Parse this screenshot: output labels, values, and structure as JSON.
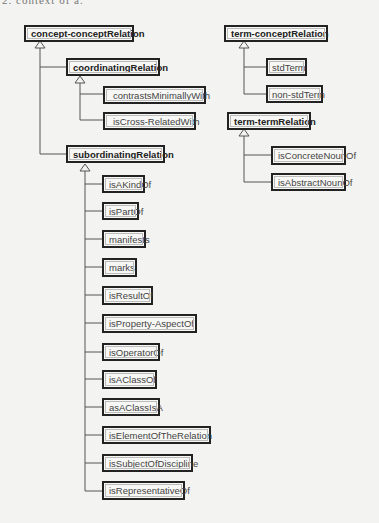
{
  "caption": "2. context of a.",
  "colors": {
    "line": "#555555",
    "box_border": "#222222",
    "background": "#f3f3f1"
  },
  "diagram": {
    "type": "class-hierarchy",
    "trees": [
      {
        "root": "concept-conceptRelation",
        "children": [
          {
            "label": "coordinatingRelation",
            "children": [
              "contrastsMinimallyWith",
              "isCross-RelatedWith"
            ]
          },
          {
            "label": "subordinatingRelation",
            "children": [
              "isAKindOf",
              "isPartOf",
              "manifests",
              "marks",
              "isResultOf",
              "isProperty-AspectOf",
              "isOperatorOf",
              "isAClassOf",
              "asAClassIsA",
              "isElementOfTheRelation",
              "isSubjectOfDiscipline",
              "isRepresentativeOf"
            ]
          }
        ]
      },
      {
        "root": "term-conceptRelation",
        "children": [
          "stdTerm",
          "non-stdTerm"
        ]
      },
      {
        "root": "term-termRelation",
        "children": [
          "isConcreteNounOf",
          "isAbstractNounOf"
        ]
      }
    ]
  },
  "nodes": {
    "ccr": "concept-conceptRelation",
    "coord": "coordinatingRelation",
    "cmw": "contrastsMinimallyWith",
    "icrw": "isCross-RelatedWith",
    "sub": "subordinatingRelation",
    "s0": "isAKindOf",
    "s1": "isPartOf",
    "s2": "manifests",
    "s3": "marks",
    "s4": "isResultOf",
    "s5": "isProperty-AspectOf",
    "s6": "isOperatorOf",
    "s7": "isAClassOf",
    "s8": "asAClassIsA",
    "s9": "isElementOfTheRelation",
    "s10": "isSubjectOfDiscipline",
    "s11": "isRepresentativeOf",
    "tcr": "term-conceptRelation",
    "std": "stdTerm",
    "nstd": "non-stdTerm",
    "ttr": "term-termRelation",
    "icn": "isConcreteNounOf",
    "ian": "isAbstractNounOf"
  }
}
